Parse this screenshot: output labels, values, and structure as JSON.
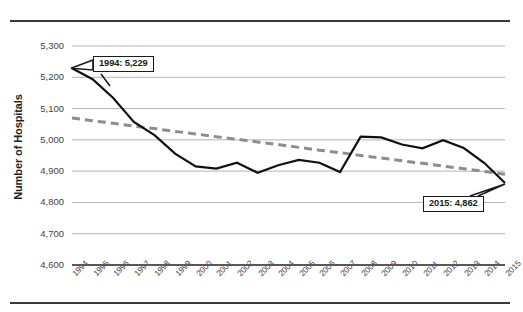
{
  "chart_data": {
    "type": "line",
    "title": "",
    "xlabel": "",
    "ylabel": "Number of Hospitals",
    "ylim": [
      4600,
      5300
    ],
    "ytick_step": 100,
    "grid": true,
    "legend": "none",
    "categories": [
      "1994",
      "1995",
      "1996",
      "1997",
      "1998",
      "1999",
      "2000",
      "2001",
      "2002",
      "2003",
      "2004",
      "2005",
      "2006",
      "2007",
      "2008",
      "2009",
      "2010",
      "2011",
      "2012",
      "2013",
      "2014",
      "2015"
    ],
    "yticks": [
      "4,600",
      "4,700",
      "4,800",
      "4,900",
      "5,000",
      "5,100",
      "5,200",
      "5,300"
    ],
    "series": [
      {
        "name": "Number of Hospitals",
        "style": "solid",
        "color": "#111111",
        "values": [
          5229,
          5194,
          5134,
          5057,
          5015,
          4956,
          4915,
          4908,
          4927,
          4895,
          4919,
          4936,
          4927,
          4897,
          5010,
          5008,
          4985,
          4973,
          4999,
          4974,
          4926,
          4862
        ]
      },
      {
        "name": "Trendline",
        "style": "dashed",
        "color": "#8d8d90",
        "values": [
          5070,
          5061,
          5053,
          5044,
          5036,
          5027,
          5019,
          5010,
          5002,
          4993,
          4985,
          4976,
          4967,
          4959,
          4950,
          4942,
          4933,
          4925,
          4916,
          4908,
          4899,
          4890
        ]
      }
    ],
    "annotations": [
      {
        "id": "start",
        "label": "1994: 5,229",
        "year": "1994",
        "value": 5229
      },
      {
        "id": "end",
        "label": "2015: 4,862",
        "year": "2015",
        "value": 4862
      }
    ]
  },
  "colors": {
    "line": "#111111",
    "trendline": "#8d8d90",
    "gridline": "#b4b4b6",
    "axis": "#58585b",
    "rule": "#3a3a3c",
    "text": "#231f20",
    "background": "#ffffff"
  }
}
